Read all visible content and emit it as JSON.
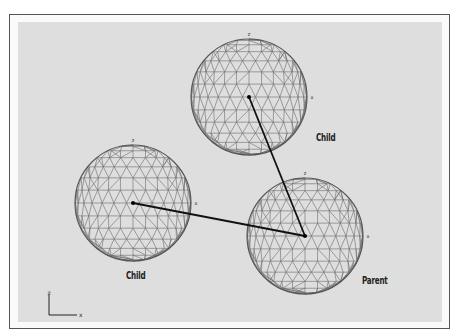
{
  "diagram": {
    "type": "wireframe-hierarchy",
    "colors": {
      "background": "#dedede",
      "frame": "#555555",
      "mesh": "#6a6a6a",
      "link": "#111111"
    },
    "nodes": [
      {
        "id": "child-top",
        "label": "Child",
        "cx": 249,
        "cy": 97,
        "r": 58,
        "label_x": 316,
        "label_y": 132
      },
      {
        "id": "child-left",
        "label": "Child",
        "cx": 133,
        "cy": 203,
        "r": 58,
        "label_x": 126,
        "label_y": 270
      },
      {
        "id": "parent",
        "label": "Parent",
        "cx": 305,
        "cy": 236,
        "r": 58,
        "label_x": 362,
        "label_y": 275
      }
    ],
    "links": [
      {
        "from": "parent",
        "to": "child-top"
      },
      {
        "from": "parent",
        "to": "child-left"
      }
    ],
    "axis_markers": {
      "z": "z",
      "x": "x"
    }
  },
  "labels": {
    "child_top": "Child",
    "child_left": "Child",
    "parent": "Parent"
  },
  "gizmo": {
    "z_label": "z",
    "x_label": "x"
  }
}
